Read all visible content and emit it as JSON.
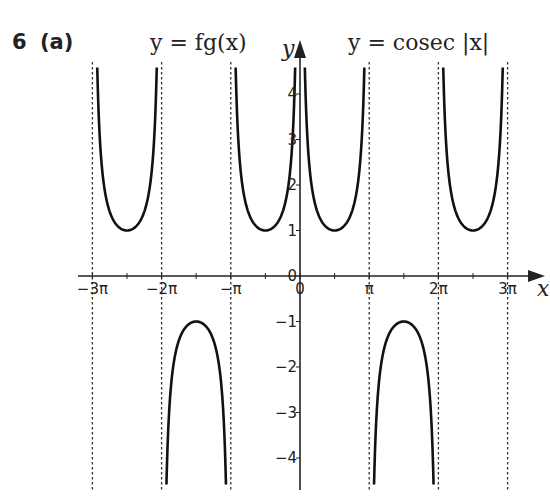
{
  "question": {
    "number": "6",
    "part": "(a)"
  },
  "labels": {
    "left_function": "y = fg(x)",
    "right_function": "y = cosec |x|",
    "x_axis": "x",
    "y_axis": "y"
  },
  "chart_data": {
    "type": "line",
    "title": "",
    "xlabel": "x",
    "ylabel": "y",
    "x_ticks": [
      "−3π",
      "−2π",
      "−π",
      "0",
      "π",
      "2π",
      "3π"
    ],
    "x_tick_values": [
      -9.4248,
      -6.2832,
      -3.1416,
      0,
      3.1416,
      6.2832,
      9.4248
    ],
    "y_ticks": [
      "−4",
      "−3",
      "−2",
      "−1",
      "0",
      "1",
      "2",
      "3",
      "4"
    ],
    "y_tick_values": [
      -4,
      -3,
      -2,
      -1,
      0,
      1,
      2,
      3,
      4
    ],
    "xlim": [
      -9.9,
      10.3
    ],
    "ylim": [
      -4.7,
      4.7
    ],
    "asymptotes_x": [
      "−3π",
      "−2π",
      "−π",
      "π",
      "2π",
      "3π"
    ],
    "grid": false,
    "series": [
      {
        "name": "y = cosec|x|",
        "branches": [
          {
            "interval": "(0, π)",
            "turning_point": {
              "x": "π/2",
              "y": 1
            },
            "shape": "U"
          },
          {
            "interval": "(π, 2π)",
            "turning_point": {
              "x": "3π/2",
              "y": -1
            },
            "shape": "∩"
          },
          {
            "interval": "(2π, 3π)",
            "turning_point": {
              "x": "5π/2",
              "y": 1
            },
            "shape": "U"
          }
        ]
      },
      {
        "name": "y = fg(x)",
        "branches": [
          {
            "interval": "(−π, 0)",
            "turning_point": {
              "x": "−π/2",
              "y": 1
            },
            "shape": "U"
          },
          {
            "interval": "(−2π, −π)",
            "turning_point": {
              "x": "−3π/2",
              "y": -1
            },
            "shape": "∩"
          },
          {
            "interval": "(−3π, −2π)",
            "turning_point": {
              "x": "−5π/2",
              "y": 1
            },
            "shape": "U"
          }
        ]
      }
    ]
  }
}
